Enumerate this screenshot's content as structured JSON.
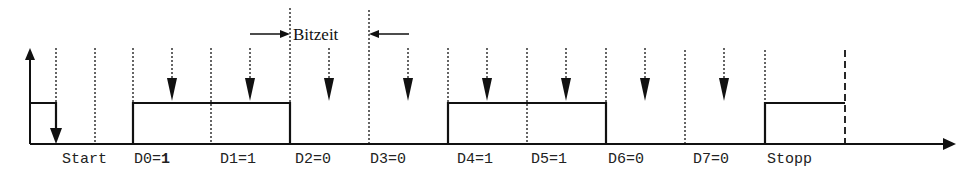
{
  "diagram": {
    "title_annotation": "Bitzeit",
    "signal_levels": {
      "high_y": 103,
      "low_y": 144
    },
    "colors": {
      "line": "#111111",
      "text": "#222222",
      "background": "#ffffff"
    },
    "labels": [
      {
        "id": "start",
        "text": "Start",
        "x": 62
      },
      {
        "id": "d0",
        "text": "D0=",
        "bold_suffix": "1",
        "x": 134
      },
      {
        "id": "d1",
        "text": "D1=1",
        "x": 220
      },
      {
        "id": "d2",
        "text": "D2=0",
        "x": 295
      },
      {
        "id": "d3",
        "text": "D3=0",
        "x": 370
      },
      {
        "id": "d4",
        "text": "D4=1",
        "x": 457
      },
      {
        "id": "d5",
        "text": "D5=1",
        "x": 531
      },
      {
        "id": "d6",
        "text": "D6=0",
        "x": 608
      },
      {
        "id": "d7",
        "text": "D7=0",
        "x": 693
      },
      {
        "id": "stopp",
        "text": "Stopp",
        "x": 767
      }
    ],
    "bits": [
      {
        "name": "Start",
        "value": 0
      },
      {
        "name": "D0",
        "value": 1
      },
      {
        "name": "D1",
        "value": 1
      },
      {
        "name": "D2",
        "value": 0
      },
      {
        "name": "D3",
        "value": 0
      },
      {
        "name": "D4",
        "value": 1
      },
      {
        "name": "D5",
        "value": 1
      },
      {
        "name": "D6",
        "value": 0
      },
      {
        "name": "D7",
        "value": 0
      },
      {
        "name": "Stopp",
        "value": 1
      }
    ]
  }
}
